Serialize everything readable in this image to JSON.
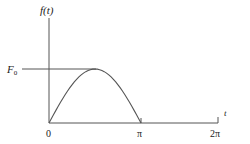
{
  "chart_data": {
    "type": "line",
    "title": "",
    "xlabel": "t",
    "ylabel": "f(t)",
    "x_ticks": [
      "0",
      "π",
      "2π"
    ],
    "y_ticks": [
      "F0"
    ],
    "xlim": [
      0,
      6.2832
    ],
    "ylim": [
      0,
      1.9
    ],
    "grid": false,
    "legend": null,
    "series": [
      {
        "name": "f(t) = F0·sin(t), 0 ≤ t ≤ π; 0 otherwise",
        "x": [
          0,
          0.3927,
          0.7854,
          1.1781,
          1.5708,
          1.9635,
          2.3562,
          2.7489,
          3.1416
        ],
        "y": [
          0,
          0.383,
          0.707,
          0.924,
          1.0,
          0.924,
          0.707,
          0.383,
          0
        ]
      }
    ],
    "annotations": [
      {
        "text": "F0",
        "note": "horizontal reference line from y-axis to peak at t = π/2"
      }
    ]
  },
  "labels": {
    "y_axis": "f(t)",
    "x_axis": "t",
    "origin": "0",
    "pi": "π",
    "two_pi": "2π",
    "f0_main": "F",
    "f0_sub": "0"
  }
}
